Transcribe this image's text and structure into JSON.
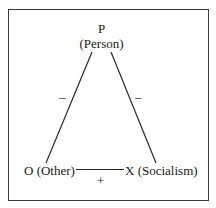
{
  "diagram": {
    "type": "balance-triangle",
    "nodes": {
      "p": {
        "letter": "P",
        "name": "(Person)"
      },
      "o": {
        "label": "O (Other)"
      },
      "x": {
        "label": "X (Socialism)"
      }
    },
    "edges": {
      "p_o": {
        "sign": "–"
      },
      "p_x": {
        "sign": "–"
      },
      "o_x": {
        "sign": "+"
      }
    },
    "colors": {
      "stroke": "#3a3a3a",
      "text": "#1a1a1a",
      "background": "#ffffff"
    }
  }
}
